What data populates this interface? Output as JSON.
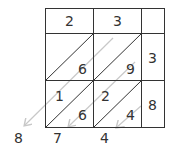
{
  "multiplicand_digits": [
    "2",
    "3"
  ],
  "multiplier_digits": [
    "3",
    "8"
  ],
  "cells": [
    {
      "row": 0,
      "col": 0,
      "tens": "",
      "ones": "6"
    },
    {
      "row": 0,
      "col": 1,
      "tens": "",
      "ones": "9"
    },
    {
      "row": 1,
      "col": 0,
      "tens": "1",
      "ones": "6"
    },
    {
      "row": 1,
      "col": 1,
      "tens": "2",
      "ones": "4"
    }
  ],
  "result_digits": [
    "8",
    "7",
    "4"
  ],
  "colors": {
    "grid": "#333333",
    "arrows": "#c8c8c8",
    "text": "#333333"
  }
}
